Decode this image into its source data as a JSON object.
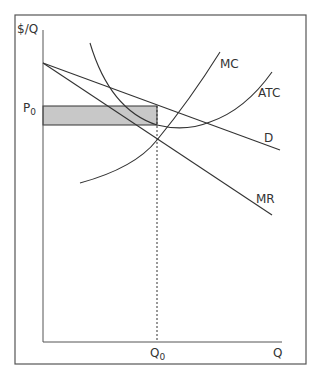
{
  "diagram": {
    "type": "monopoly-profit-maximization",
    "axes": {
      "y_label": "$/Q",
      "x_label": "Q"
    },
    "curves": {
      "mc_label": "MC",
      "atc_label": "ATC",
      "demand_label": "D",
      "mr_label": "MR"
    },
    "markers": {
      "price_label": "P",
      "price_subscript": "0",
      "quantity_label": "Q",
      "quantity_subscript": "0"
    },
    "shaded_region": {
      "meaning": "economic profit",
      "fill": "#c8c8c8"
    },
    "colors": {
      "line": "#333333",
      "frame": "#555555",
      "shade": "#c8c8c8"
    }
  }
}
